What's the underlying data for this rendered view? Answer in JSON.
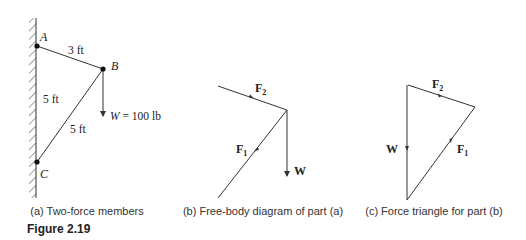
{
  "figure": {
    "title": "Figure 2.19"
  },
  "panel_a": {
    "caption": "(a) Two-force members",
    "points": {
      "A": "A",
      "B": "B",
      "C": "C"
    },
    "dims": {
      "AB": "3 ft",
      "AC": "5 ft",
      "BC": "5 ft"
    },
    "load": "W = 100 lb"
  },
  "panel_b": {
    "caption": "(b) Free-body diagram of part (a)",
    "f1": "F",
    "f1_sub": "1",
    "f2": "F",
    "f2_sub": "2",
    "w": "W"
  },
  "panel_c": {
    "caption": "(c) Force triangle for part (b)",
    "f1": "F",
    "f1_sub": "1",
    "f2": "F",
    "f2_sub": "2",
    "w": "W"
  },
  "colors": {
    "line": "#333333",
    "text": "#222222"
  }
}
